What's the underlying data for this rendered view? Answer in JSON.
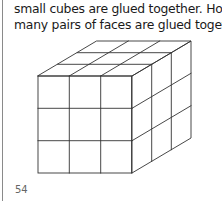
{
  "question": {
    "lines": [
      "small cubes are glued together. How",
      "many pairs of faces are glued together?"
    ]
  },
  "figure": {
    "grid_size": 3,
    "line_color": "#333333"
  },
  "page": {
    "number": "54"
  }
}
